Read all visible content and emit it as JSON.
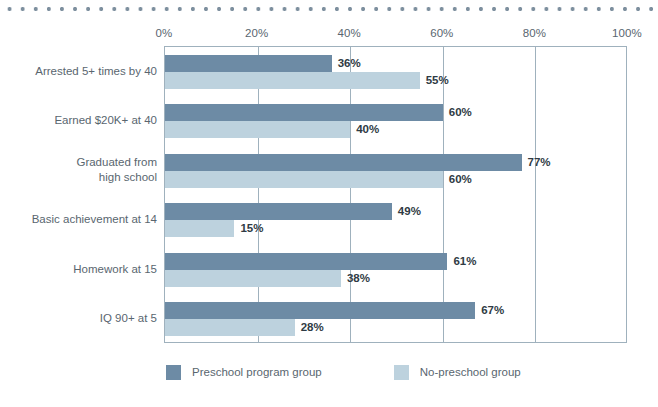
{
  "decor": {
    "top_rule": "dotted-rule"
  },
  "chart_data": {
    "type": "bar",
    "orientation": "horizontal",
    "title": "",
    "xlabel": "",
    "ylabel": "",
    "xlim": [
      0,
      100
    ],
    "xticks": [
      "0%",
      "20%",
      "40%",
      "60%",
      "80%",
      "100%"
    ],
    "xtick_values": [
      0,
      20,
      40,
      60,
      80,
      100
    ],
    "grid": true,
    "grid_axis": "x",
    "legend_position": "bottom",
    "categories": [
      "Arrested 5+ times by 40",
      "Earned $20K+ at 40",
      "Graduated from\nhigh school",
      "Basic achievement at 14",
      "Homework at 15",
      "IQ 90+ at 5"
    ],
    "category_lines": [
      [
        "Arrested 5+ times by 40"
      ],
      [
        "Earned $20K+ at 40"
      ],
      [
        "Graduated from",
        "high school"
      ],
      [
        "Basic achievement at 14"
      ],
      [
        "Homework at 15"
      ],
      [
        "IQ 90+ at 5"
      ]
    ],
    "series": [
      {
        "name": "Preschool program group",
        "color": "#6d8ba5",
        "values": [
          36,
          60,
          77,
          49,
          61,
          67
        ],
        "labels": [
          "36%",
          "60%",
          "77%",
          "49%",
          "61%",
          "67%"
        ]
      },
      {
        "name": "No-preschool group",
        "color": "#bdd2de",
        "values": [
          55,
          40,
          60,
          15,
          38,
          28
        ],
        "labels": [
          "55%",
          "40%",
          "60%",
          "15%",
          "38%",
          "28%"
        ]
      }
    ]
  },
  "colors": {
    "series_dark": "#6d8ba5",
    "series_light": "#bdd2de",
    "axis": "#9fb1bd",
    "text": "#59666f",
    "value_text": "#2f3b44",
    "dot_rule": "#7d8f9e",
    "background": "#ffffff"
  }
}
